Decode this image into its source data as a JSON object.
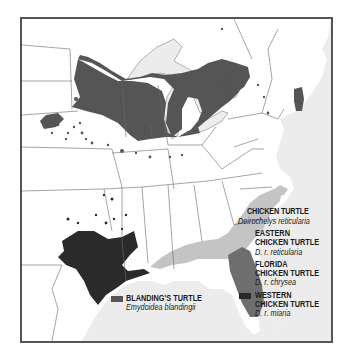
{
  "map": {
    "region": "Eastern United States",
    "colors": {
      "background": "#ffffff",
      "water": "#ececec",
      "state_border": "#6a6a6a",
      "frame": "#555555",
      "blandings": "#555555",
      "eastern_chicken": "#c4c4c4",
      "florida_chicken": "#6e6e6e",
      "western_chicken": "#2a2a2a"
    }
  },
  "legend_chicken": {
    "title": "CHICKEN TURTLE",
    "scientific": "Deirochelys reticularia",
    "items": [
      {
        "line1": "EASTERN",
        "line2": "CHICKEN TURTLE",
        "sci": "D. r. reticularia",
        "color": "#c4c4c4"
      },
      {
        "line1": "FLORIDA",
        "line2": "CHICKEN TURTLE",
        "sci": "D. r. chrysea",
        "color": "#6e6e6e"
      },
      {
        "line1": "WESTERN",
        "line2": "CHICKEN TURTLE",
        "sci": "D. r. miaria",
        "color": "#2a2a2a"
      }
    ]
  },
  "legend_blandings": {
    "title": "BLANDING'S TURTLE",
    "scientific": "Emydoidea blandingii",
    "color": "#555555"
  }
}
